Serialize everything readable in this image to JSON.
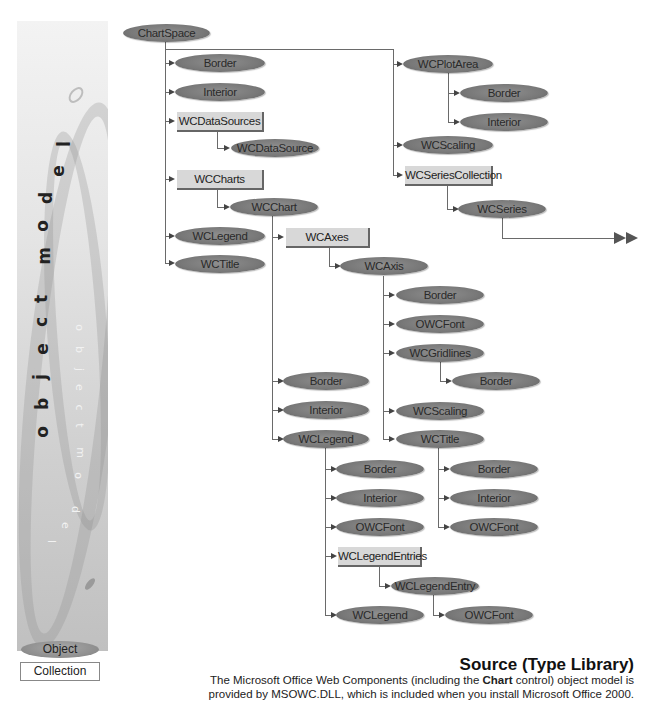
{
  "sidebar": {
    "title_vertical": "object model",
    "title_vertical_light": "object model",
    "legend": {
      "object_label": "Object",
      "collection_label": "Collection"
    }
  },
  "diagram": {
    "nodes": {
      "chartspace": "ChartSpace",
      "cs_border": "Border",
      "cs_interior": "Interior",
      "wcdatasources": "WCDataSources",
      "wcdatasource": "WCDataSource",
      "wccharts": "WCCharts",
      "wcchart": "WCChart",
      "cs_wclegend": "WCLegend",
      "cs_wctitle": "WCTitle",
      "wcplotarea": "WCPlotArea",
      "pa_border": "Border",
      "pa_interior": "Interior",
      "cs_wcscaling": "WCScaling",
      "wcseriescollection": "WCSeriesCollection",
      "wcseries": "WCSeries",
      "wcaxes": "WCAxes",
      "wcaxis": "WCAxis",
      "ax_border": "Border",
      "ax_owcfont": "OWCFont",
      "wcgridlines": "WCGridlines",
      "gl_border": "Border",
      "ax_wcscaling": "WCScaling",
      "ax_wctitle": "WCTitle",
      "ch_border": "Border",
      "ch_interior": "Interior",
      "ch_wclegend": "WCLegend",
      "lg_border": "Border",
      "lg_interior": "Interior",
      "lg_owcfont": "OWCFont",
      "wclegendentries": "WCLegendEntries",
      "wclegendentry": "WCLegendEntry",
      "le_owcfont": "OWCFont",
      "lg_wclegend": "WCLegend",
      "tt_border": "Border",
      "tt_interior": "Interior",
      "tt_owcfont": "OWCFont"
    }
  },
  "footer": {
    "title": "Source (Type Library)",
    "description_pre": "The Microsoft Office Web Components (including the ",
    "description_bold": "Chart",
    "description_post": " control) object model is provided by MSOWC.DLL, which is included when you install Microsoft Office 2000."
  },
  "colors": {
    "object_fill": "#7a7a7a",
    "collection_fill": "#d8d8d8",
    "connector": "#6a6a6a"
  }
}
